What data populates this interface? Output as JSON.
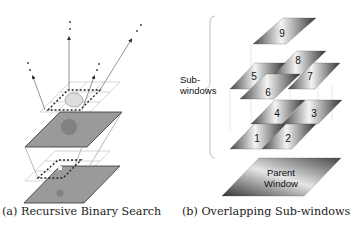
{
  "panel_a": {
    "caption": "(a) Recursive Binary Search"
  },
  "panel_b": {
    "caption": "(b) Overlapping Sub-windows",
    "brace_label_line1": "Sub-",
    "brace_label_line2": "windows",
    "subwindows": [
      "1",
      "2",
      "3",
      "4",
      "5",
      "6",
      "7",
      "8",
      "9"
    ],
    "parent_line1": "Parent",
    "parent_line2": "Window"
  }
}
